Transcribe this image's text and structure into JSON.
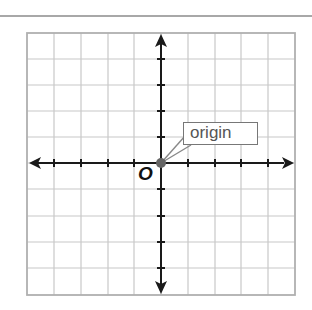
{
  "diagram": {
    "type": "coordinate-plane",
    "grid": {
      "columns": 10,
      "rows": 10,
      "line_color": "#c8c8c8",
      "border_color": "#b0b0b0"
    },
    "axes": {
      "color": "#1a1a1a",
      "arrows": [
        "left",
        "right",
        "up",
        "down"
      ]
    },
    "origin_label": "O",
    "callout_text": "origin",
    "point_color": "#666666"
  }
}
